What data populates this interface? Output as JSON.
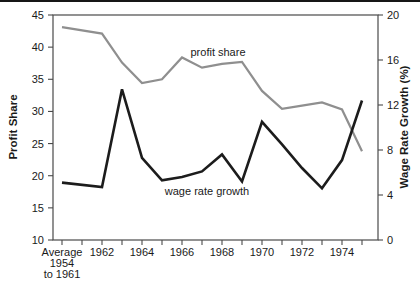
{
  "page": {
    "background": "#ffffff",
    "top_rule_color": "#161616",
    "text_color": "#1a1a1a",
    "frame_color": "#4a4a4a"
  },
  "chart_data": {
    "type": "line",
    "title": "",
    "categories": [
      "Average 1954 to 1961",
      "1962",
      "1963",
      "1964",
      "1965",
      "1966",
      "1967",
      "1968",
      "1969",
      "1970",
      "1971",
      "1972",
      "1973",
      "1974",
      "1975"
    ],
    "x_axis": {
      "first_label_lines": [
        "Average",
        "1954",
        "to 1961"
      ],
      "labeled_year_ticks": [
        "1962",
        "1964",
        "1966",
        "1968",
        "1970",
        "1972",
        "1974"
      ],
      "minor_ticks_between_years": true
    },
    "left_axis": {
      "label": "Profit Share",
      "min": 10,
      "max": 45,
      "ticks": [
        45,
        40,
        35,
        30,
        25,
        20,
        15,
        10
      ]
    },
    "right_axis": {
      "label": "Wage Rate Growth (%)",
      "min": 0,
      "max": 20,
      "ticks": [
        20,
        16,
        12,
        8,
        4,
        0
      ]
    },
    "grid": false,
    "legend": "inline-labels",
    "series": [
      {
        "name": "profit share",
        "axis": "left",
        "color": "#8f8f8f",
        "stroke_width": 2.2,
        "values": [
          43.1,
          42.1,
          37.6,
          34.4,
          35.0,
          38.4,
          36.8,
          37.4,
          37.7,
          33.2,
          30.4,
          30.9,
          31.4,
          30.3,
          23.8
        ],
        "inline_label": {
          "text": "profit share",
          "x": 218,
          "y": 56
        }
      },
      {
        "name": "wage rate growth",
        "axis": "right",
        "color": "#1c1c1c",
        "stroke_width": 2.6,
        "values": [
          5.1,
          4.7,
          13.4,
          7.3,
          5.3,
          5.6,
          6.1,
          7.6,
          5.2,
          10.5,
          8.5,
          6.4,
          4.6,
          7.1,
          12.4
        ],
        "inline_label": {
          "text": "wage rate growth",
          "x": 207,
          "y": 195
        }
      }
    ]
  }
}
